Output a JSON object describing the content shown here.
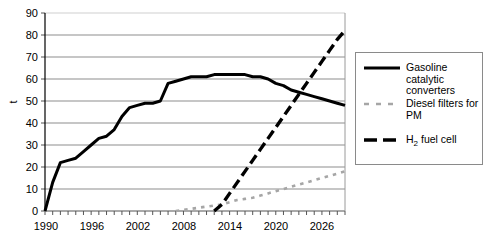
{
  "chart_data": {
    "type": "line",
    "title": "",
    "xlabel": "",
    "ylabel": "t",
    "xlim": [
      1990,
      2029
    ],
    "ylim": [
      0,
      90
    ],
    "ytick_step": 10,
    "yticks": [
      0,
      10,
      20,
      30,
      40,
      50,
      60,
      70,
      80,
      90
    ],
    "xticks_labeled": [
      1990,
      1996,
      2002,
      2008,
      2014,
      2020,
      2026
    ],
    "xtick_step": 1,
    "grid": "horizontal",
    "legend_position": "right",
    "series": [
      {
        "name": "Gasoline catalytic converters",
        "style": "solid",
        "color": "#000000",
        "x": [
          1990,
          1991,
          1992,
          1993,
          1994,
          1995,
          1996,
          1997,
          1998,
          1999,
          2000,
          2001,
          2002,
          2003,
          2004,
          2005,
          2006,
          2007,
          2008,
          2009,
          2010,
          2011,
          2012,
          2013,
          2014,
          2015,
          2016,
          2017,
          2018,
          2019,
          2020,
          2021,
          2022,
          2023,
          2024,
          2025,
          2026,
          2027,
          2028,
          2029
        ],
        "values": [
          0,
          13,
          22,
          23,
          24,
          27,
          30,
          33,
          34,
          37,
          43,
          47,
          48,
          49,
          49,
          50,
          58,
          59,
          60,
          61,
          61,
          61,
          62,
          62,
          62,
          62,
          62,
          61,
          61,
          60,
          58,
          57,
          55,
          54,
          53,
          52,
          51,
          50,
          49,
          48
        ]
      },
      {
        "name": "Diesel filters for PM",
        "style": "dotted",
        "color": "#a6a6a6",
        "x": [
          2007,
          2008,
          2009,
          2010,
          2011,
          2012,
          2013,
          2014,
          2015,
          2016,
          2017,
          2018,
          2019,
          2020,
          2021,
          2022,
          2023,
          2024,
          2025,
          2026,
          2027,
          2028,
          2029
        ],
        "values": [
          0,
          0.5,
          1,
          1.5,
          2,
          2.5,
          3,
          4,
          5,
          5.5,
          6,
          7,
          8,
          9,
          10,
          11,
          12,
          13,
          14,
          15,
          16,
          17,
          18
        ]
      },
      {
        "name": "H2 fuel cell",
        "style": "dashed",
        "color": "#000000",
        "x": [
          2012,
          2013,
          2014,
          2015,
          2016,
          2017,
          2018,
          2019,
          2020,
          2021,
          2022,
          2023,
          2024,
          2025,
          2026,
          2027,
          2028,
          2029
        ],
        "values": [
          0,
          3,
          8,
          13,
          18,
          23,
          28,
          33,
          38,
          43,
          48,
          53,
          58,
          63,
          68,
          73,
          78,
          82
        ]
      }
    ]
  },
  "axes": {
    "ylabel": "t",
    "yticks": [
      "0",
      "10",
      "20",
      "30",
      "40",
      "50",
      "60",
      "70",
      "80",
      "90"
    ],
    "xticks": [
      "1990",
      "1996",
      "2002",
      "2008",
      "2014",
      "2020",
      "2026"
    ]
  },
  "legend": {
    "items": [
      {
        "label_line1": "Gasoline",
        "label_line2": "catalytic",
        "label_line3": "converters",
        "sample": "solid-line-sample"
      },
      {
        "label_line1": "Diesel filters for",
        "label_line2": "PM",
        "label_line3": "",
        "sample": "dotted-line-sample"
      },
      {
        "label_line1": "H",
        "label_sub": "2",
        "label_line2": " fuel cell",
        "label_line3": "",
        "sample": "dashed-line-sample"
      }
    ]
  }
}
